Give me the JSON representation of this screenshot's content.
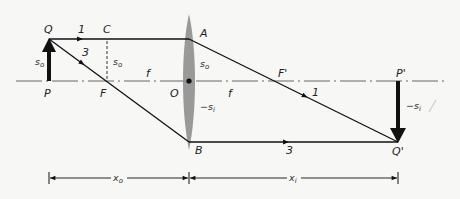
{
  "figure": {
    "type": "thin-lens ray diagram",
    "colors": {
      "ray": "#111111",
      "axis": "#555555",
      "lens": "#8e8e8e",
      "background": "#f7f7f5"
    },
    "points": {
      "Q": "Q",
      "P": "P",
      "C": "C",
      "F": "F",
      "O": "O",
      "A": "A",
      "B": "B",
      "F_prime": "F'",
      "P_prime": "P'",
      "Q_prime": "Q'"
    },
    "rays": {
      "ray1": "1",
      "ray3": "3",
      "ray1_after": "1",
      "ray3_after": "3"
    },
    "labels": {
      "object_height": {
        "main": "s",
        "sub": "o"
      },
      "object_height_C": {
        "main": "s",
        "sub": "o"
      },
      "object_height_lens": {
        "main": "s",
        "sub": "o"
      },
      "image_height_lens": {
        "main": "−s",
        "sub": "i"
      },
      "image_height": {
        "main": "−s",
        "sub": "i"
      },
      "focal_left": "f",
      "focal_right": "f",
      "object_distance": {
        "main": "x",
        "sub": "o"
      },
      "image_distance": {
        "main": "x",
        "sub": "i"
      }
    }
  }
}
